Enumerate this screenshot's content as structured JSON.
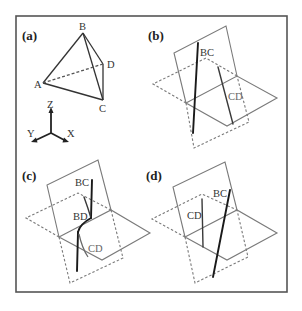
{
  "figure": {
    "panels": [
      {
        "id": "a",
        "label": "(a)",
        "description": "Tetrahedron ABCD with coordinate axes",
        "vertices": {
          "A": "A",
          "B": "B",
          "C": "C",
          "D": "D"
        },
        "axes": {
          "z": "Z",
          "y": "Y",
          "x": "X"
        }
      },
      {
        "id": "b",
        "label": "(b)",
        "lines": {
          "bc": "BC",
          "cd": "CD"
        }
      },
      {
        "id": "c",
        "label": "(c)",
        "lines": {
          "bc": "BC",
          "bd": "BD",
          "cd": "CD"
        }
      },
      {
        "id": "d",
        "label": "(d)",
        "lines": {
          "cd": "CD",
          "bc": "BC"
        }
      }
    ]
  },
  "colors": {
    "frame": "#555555",
    "plane": "#7a7a7a",
    "line": "#1a1a1a",
    "background": "#ffffff"
  }
}
